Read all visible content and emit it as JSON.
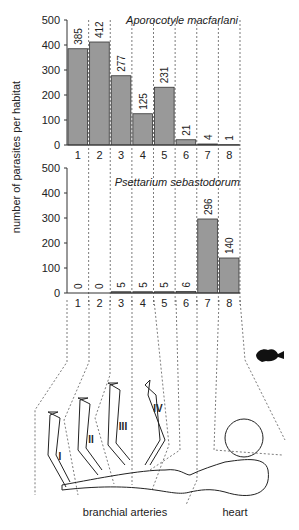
{
  "chart_data": [
    {
      "type": "bar",
      "title": "Aporocotyle macfarlani",
      "xlabel": "",
      "ylabel": "number of parasites per habitat",
      "categories": [
        "1",
        "2",
        "3",
        "4",
        "5",
        "6",
        "7",
        "8"
      ],
      "values": [
        385,
        412,
        277,
        125,
        231,
        21,
        4,
        1
      ],
      "ylim": [
        0,
        500
      ],
      "yticks": [
        0,
        100,
        200,
        300,
        400,
        500
      ],
      "grid": "vertical dashed separators",
      "bar_color": "#999999"
    },
    {
      "type": "bar",
      "title": "Psettarium sebastodorum",
      "xlabel": "",
      "ylabel": "number of parasites per habitat",
      "categories": [
        "1",
        "2",
        "3",
        "4",
        "5",
        "6",
        "7",
        "8"
      ],
      "values": [
        0,
        0,
        5,
        5,
        5,
        6,
        296,
        140
      ],
      "ylim": [
        0,
        500
      ],
      "yticks": [
        0,
        100,
        200,
        300,
        400,
        500
      ],
      "grid": "vertical dashed separators",
      "bar_color": "#999999"
    }
  ],
  "labels": {
    "ylabel": "number of parasites per habitat",
    "top_title": "Aporocotyle macfarlani",
    "bottom_title": "Psettarium sebastodorum",
    "arch_labels": [
      "I",
      "II",
      "III",
      "IV"
    ],
    "branchial": "branchial arteries",
    "heart": "heart"
  }
}
